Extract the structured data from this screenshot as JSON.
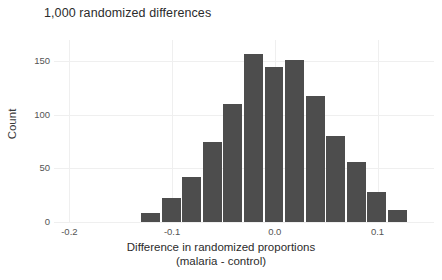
{
  "chart_data": {
    "type": "bar",
    "title": "1,000 randomized differences",
    "xlabel_line1": "Difference in randomized proportions",
    "xlabel_line2": "(malaria - control)",
    "ylabel": "Count",
    "grid": true,
    "legend": "none",
    "bar_color": "#4d4d4d",
    "xlim": [
      -0.215,
      0.155
    ],
    "ylim": [
      0,
      170
    ],
    "bin_width": 0.02,
    "x_ticks": [
      -0.2,
      -0.1,
      0.0,
      0.1
    ],
    "x_tick_labels": [
      "-0.2",
      "-0.1",
      "0.0",
      "0.1"
    ],
    "y_ticks": [
      0,
      50,
      100,
      150
    ],
    "y_tick_labels": [
      "0",
      "50",
      "100",
      "150"
    ],
    "bin_centers": [
      -0.12,
      -0.1,
      -0.08,
      -0.06,
      -0.04,
      -0.02,
      0.0,
      0.02,
      0.04,
      0.06,
      0.08,
      0.1,
      0.12
    ],
    "bin_left_edges": [
      -0.13,
      -0.11,
      -0.09,
      -0.07,
      -0.05,
      -0.03,
      -0.01,
      0.01,
      0.03,
      0.05,
      0.07,
      0.09,
      0.11
    ],
    "values": [
      8,
      22,
      42,
      75,
      110,
      157,
      145,
      151,
      118,
      80,
      56,
      28,
      11
    ],
    "total_count": 1000
  }
}
